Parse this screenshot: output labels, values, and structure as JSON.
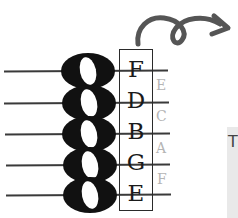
{
  "staff": {
    "line_notes": [
      "E",
      "G",
      "B",
      "D",
      "F"
    ],
    "line_notes_top_down": [
      "F",
      "D",
      "B",
      "G",
      "E"
    ],
    "space_notes_top_down": [
      "E",
      "C",
      "A",
      "F"
    ]
  },
  "labels": {
    "line_0": "F",
    "line_1": "D",
    "line_2": "B",
    "line_3": "G",
    "line_4": "E",
    "space_0": "E",
    "space_1": "C",
    "space_2": "A",
    "space_3": "F"
  },
  "side_panel": {
    "char": "T"
  },
  "colors": {
    "ink": "#111111",
    "space_label": "#b5b5b5",
    "arrow": "#555555",
    "panel": "#e9e9e9"
  },
  "icons": {
    "arrow": "curly-arrow-icon",
    "notes": "whole-note-icon"
  }
}
